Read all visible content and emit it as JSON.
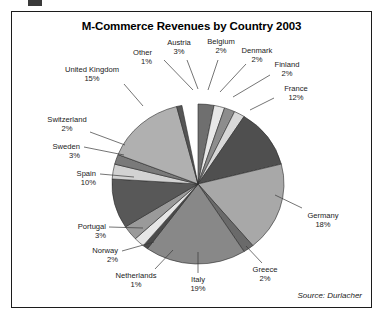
{
  "chart_data": {
    "type": "pie",
    "title": "M-Commerce Revenues by Country 2003",
    "source": "Source: Durlacher",
    "unit": "%",
    "legend_position": "none",
    "labels_outside": true,
    "categories": [
      "Austria",
      "Belgium",
      "Denmark",
      "Finland",
      "France",
      "Germany",
      "Greece",
      "Italy",
      "Netherlands",
      "Norway",
      "Portugal",
      "Spain",
      "Sweden",
      "Switzerland",
      "United Kingdom",
      "Other"
    ],
    "values": [
      3,
      2,
      2,
      2,
      12,
      18,
      2,
      19,
      1,
      2,
      3,
      10,
      3,
      2,
      15,
      1
    ],
    "slices": [
      {
        "name": "Austria",
        "value": 3,
        "label": "Austria",
        "pct": "3%",
        "color": "#6f6f6f",
        "start_deg": 0,
        "end_deg": 10.8
      },
      {
        "name": "Belgium",
        "value": 2,
        "label": "Belgium",
        "pct": "2%",
        "color": "#e8e8e8",
        "start_deg": 10.8,
        "end_deg": 18.0
      },
      {
        "name": "Denmark",
        "value": 2,
        "label": "Denmark",
        "pct": "2%",
        "color": "#8d8d8d",
        "start_deg": 18.0,
        "end_deg": 25.2
      },
      {
        "name": "Finland",
        "value": 2,
        "label": "Finland",
        "pct": "2%",
        "color": "#d8d8d8",
        "start_deg": 25.2,
        "end_deg": 32.4
      },
      {
        "name": "France",
        "value": 12,
        "label": "France",
        "pct": "12%",
        "color": "#4f4f4f",
        "start_deg": 32.4,
        "end_deg": 75.6
      },
      {
        "name": "Germany",
        "value": 18,
        "label": "Germany",
        "pct": "18%",
        "color": "#a8a8a8",
        "start_deg": 75.6,
        "end_deg": 140.4
      },
      {
        "name": "Greece",
        "value": 2,
        "label": "Greece",
        "pct": "2%",
        "color": "#6a6a6a",
        "start_deg": 140.4,
        "end_deg": 147.6
      },
      {
        "name": "Italy",
        "value": 19,
        "label": "Italy",
        "pct": "19%",
        "color": "#888888",
        "start_deg": 147.6,
        "end_deg": 216.0
      },
      {
        "name": "Netherlands",
        "value": 1,
        "label": "Netherlands",
        "pct": "1%",
        "color": "#4a4a4a",
        "start_deg": 216.0,
        "end_deg": 219.6
      },
      {
        "name": "Norway",
        "value": 2,
        "label": "Norway",
        "pct": "2%",
        "color": "#e6e6e6",
        "start_deg": 219.6,
        "end_deg": 226.8
      },
      {
        "name": "Portugal",
        "value": 3,
        "label": "Portugal",
        "pct": "3%",
        "color": "#9a9a9a",
        "start_deg": 226.8,
        "end_deg": 237.6
      },
      {
        "name": "Spain",
        "value": 10,
        "label": "Spain",
        "pct": "10%",
        "color": "#585858",
        "start_deg": 237.6,
        "end_deg": 273.6
      },
      {
        "name": "Sweden",
        "value": 3,
        "label": "Sweden",
        "pct": "3%",
        "color": "#d2d2d2",
        "start_deg": 273.6,
        "end_deg": 284.4
      },
      {
        "name": "Switzerland",
        "value": 2,
        "label": "Switzerland",
        "pct": "2%",
        "color": "#7a7a7a",
        "start_deg": 284.4,
        "end_deg": 291.6
      },
      {
        "name": "United Kingdom",
        "value": 15,
        "label": "United Kingdom",
        "pct": "15%",
        "color": "#b0b0b0",
        "start_deg": 291.6,
        "end_deg": 345.6
      },
      {
        "name": "Other",
        "value": 1,
        "label": "Other",
        "pct": "1%",
        "color": "#555555",
        "start_deg": 345.6,
        "end_deg": 349.2
      }
    ],
    "xlabel": "",
    "ylabel": ""
  },
  "frame": {
    "border_color": "#1c1c1c",
    "background": "#ffffff"
  }
}
